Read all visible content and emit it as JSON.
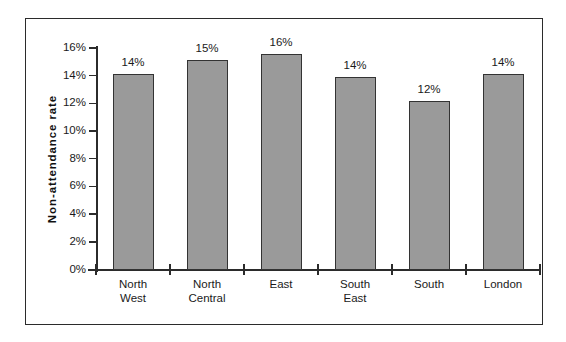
{
  "chart_data": {
    "type": "bar",
    "title": "",
    "subtitle": "",
    "xlabel": "",
    "ylabel": "Non-attendance  rate",
    "categories": [
      "North West",
      "North Central",
      "East",
      "South East",
      "South",
      "London"
    ],
    "category_lines": [
      [
        "North",
        "West"
      ],
      [
        "North",
        "Central"
      ],
      [
        "East",
        ""
      ],
      [
        "South",
        "East"
      ],
      [
        "South",
        ""
      ],
      [
        "London",
        ""
      ]
    ],
    "values": [
      14.1,
      15.1,
      15.6,
      13.9,
      12.2,
      14.1
    ],
    "data_labels": [
      "14%",
      "15%",
      "16%",
      "14%",
      "12%",
      "14%"
    ],
    "ylim": [
      0,
      16
    ],
    "ytick_values": [
      0,
      2,
      4,
      6,
      8,
      10,
      12,
      14,
      16
    ],
    "ytick_labels": [
      "0%",
      "2%",
      "4%",
      "6%",
      "8%",
      "10%",
      "12%",
      "14%",
      "16%"
    ],
    "grid": false,
    "legend": null,
    "legend_position": "none",
    "bar_color": "#9a9a9a",
    "bar_border_color": "#333333",
    "axis_color": "#2b2b2b",
    "background_color": "#ffffff",
    "frame_border_color": "#2b2b2b"
  }
}
